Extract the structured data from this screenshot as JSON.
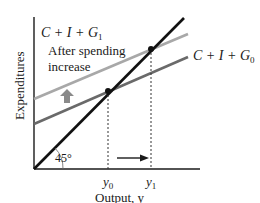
{
  "diagram": {
    "type": "keynesian-cross",
    "axes": {
      "ylabel": "Expenditures",
      "xlabel": "Output, y",
      "angle_label": "45°"
    },
    "lines": [
      {
        "id": "45-degree-line",
        "label": "",
        "color": "#111111"
      },
      {
        "id": "aggregate-expenditure-g1",
        "label_main": "C + I + G",
        "label_sub": "1",
        "color": "#a8a8a8"
      },
      {
        "id": "aggregate-expenditure-g0",
        "label_main": "C + I + G",
        "label_sub": "0",
        "color": "#6a6a6a"
      }
    ],
    "annotation": {
      "line1": "After spending",
      "line2": "increase"
    },
    "ticks": [
      {
        "label_main": "y",
        "label_sub": "0"
      },
      {
        "label_main": "y",
        "label_sub": "1"
      }
    ],
    "colors": {
      "axis": "#1a1a1a",
      "line_45": "#111111",
      "line_g1": "#a8a8a8",
      "line_g0": "#6a6a6a",
      "shift_arrow": "#8a8a8a",
      "equilibrium_dot": "#111111"
    }
  }
}
